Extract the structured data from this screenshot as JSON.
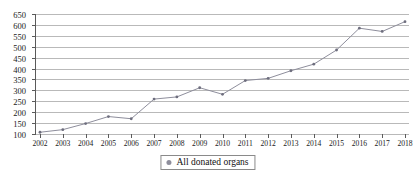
{
  "chart_data": {
    "type": "line",
    "title": "",
    "xlabel": "",
    "ylabel": "",
    "categories": [
      "2002",
      "2003",
      "2004",
      "2005",
      "2006",
      "2007",
      "2008",
      "2009",
      "2010",
      "2011",
      "2012",
      "2013",
      "2014",
      "2015",
      "2016",
      "2017",
      "2018"
    ],
    "series": [
      {
        "name": "All donated organs",
        "values": [
          108,
          120,
          148,
          180,
          170,
          260,
          270,
          312,
          282,
          345,
          355,
          390,
          420,
          485,
          585,
          570,
          615
        ]
      }
    ],
    "ylim": [
      100,
      650
    ],
    "yticks": [
      100,
      150,
      200,
      250,
      300,
      350,
      400,
      450,
      500,
      550,
      600,
      650
    ],
    "ytick_labels": [
      "100",
      "150",
      "200",
      "250",
      "300",
      "350",
      "400",
      "450",
      "500",
      "550",
      "600",
      "650"
    ],
    "grid": true,
    "legend_position": "bottom-center",
    "colors": {
      "series_line": "#8e8e9c",
      "marker": "#6e6e7e",
      "gridline": "#b9b9b9",
      "axis": "#5a5a5a",
      "text": "#1a1a1a"
    }
  },
  "legend": {
    "items": [
      {
        "label": "All donated organs",
        "marker": "round-dot-marker"
      }
    ]
  }
}
